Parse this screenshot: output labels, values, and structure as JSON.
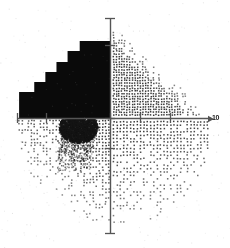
{
  "figure": {
    "title": "",
    "background_color": "#ffffff",
    "width": 230,
    "height": 248
  },
  "axes": {
    "origin_px": {
      "x": 110,
      "y": 118
    },
    "x_axis": {
      "label": "",
      "end_label": "10",
      "color": "#555555",
      "start_px": 17,
      "end_px": 211,
      "ticks_px": [
        17,
        46,
        110,
        140,
        170
      ],
      "tick_labels": [
        "",
        "",
        "",
        "",
        ""
      ]
    },
    "y_axis": {
      "label": "",
      "color": "#555555",
      "start_px": 18,
      "end_px": 233,
      "ticks_px": [
        18,
        45,
        118,
        148,
        233
      ],
      "tick_labels": [
        "",
        "",
        "",
        "",
        ""
      ]
    }
  },
  "chart_data": {
    "type": "scatter",
    "title": "",
    "subtitle": "",
    "xlabel": "",
    "ylabel": "",
    "xlim": [
      -10,
      10
    ],
    "ylim": [
      -10,
      10
    ],
    "grid": false,
    "legend": null,
    "legend_position": "none",
    "annotations": [
      {
        "name": "solid-black-staircase-region",
        "quadrant": "upper-left",
        "description": "Solid filled black step-wise region in the second quadrant, descending in five stair steps from right to left",
        "fill_color": "#0a0a0a",
        "steps": [
          {
            "x_left": -9.0,
            "x_right": -7.5,
            "y_top": 2.6
          },
          {
            "x_left": -7.5,
            "x_right": -6.4,
            "y_top": 3.6
          },
          {
            "x_left": -6.4,
            "x_right": -5.3,
            "y_top": 4.6
          },
          {
            "x_left": -5.3,
            "x_right": -4.2,
            "y_top": 5.6
          },
          {
            "x_left": -4.2,
            "x_right": -3.0,
            "y_top": 6.7
          },
          {
            "x_left": -3.0,
            "x_right": 0.0,
            "y_top": 7.7
          }
        ],
        "y_bottom": 0.0
      },
      {
        "name": "dense-dark-cluster",
        "quadrant": "lower-left",
        "description": "Very dense overlapping dark point cluster just below and left of the origin",
        "center": {
          "x": -3.2,
          "y": -0.9
        },
        "radius": {
          "x": 1.9,
          "y": 1.5
        },
        "color": "#151515"
      }
    ],
    "point_color": "#3a3a3a",
    "point_size_px": 1.6,
    "quadrant_densities": [
      {
        "quadrant": "upper-right",
        "density": "high",
        "point_count": 1250,
        "boundary": "diagonal taper from upper-left to lower-right"
      },
      {
        "quadrant": "lower-right",
        "density": "medium",
        "point_count": 780,
        "boundary": "regular grid fading toward lower-left"
      },
      {
        "quadrant": "lower-left",
        "density": "medium-high",
        "point_count": 900,
        "boundary": "dense near origin, tapering down-left"
      },
      {
        "quadrant": "upper-left",
        "density": "solid",
        "point_count": 0,
        "boundary": "fully saturated black staircase"
      }
    ],
    "envelope": {
      "description": "Overall point cloud bounded by an irregular rounded/elliptical envelope",
      "cx_px": 115,
      "cy_px": 122,
      "rx_px": 98,
      "ry_px": 104
    }
  }
}
